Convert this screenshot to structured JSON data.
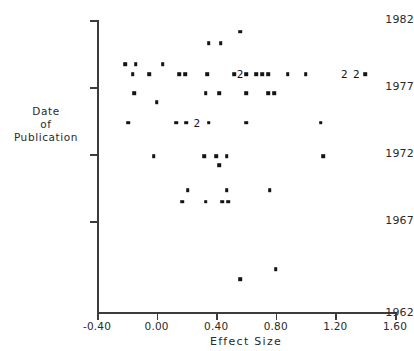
{
  "chart_data": {
    "type": "scatter",
    "title": "",
    "xlabel": "Effect  Size",
    "ylabel": "Date of Publication",
    "ylabel_lines": [
      "Date",
      "of",
      "Publication"
    ],
    "xlim": [
      -0.4,
      1.6
    ],
    "ylim": [
      1962,
      1982
    ],
    "xticks": [
      -0.4,
      0.0,
      0.4,
      0.8,
      1.2,
      1.6
    ],
    "xtick_labels": [
      "-0.40",
      "0.00",
      "0.40",
      "0.80",
      "1.20",
      "1.60"
    ],
    "yticks": [
      1962,
      1967,
      1972,
      1977,
      1982
    ],
    "ytick_labels": [
      "1962",
      "1967",
      "1972",
      "1977",
      "1982"
    ],
    "grid": false,
    "legend": null,
    "marker": "filled-square",
    "marker_color": "#141414",
    "axis_color": "#3c3c3c",
    "background_color": "#ffffff",
    "points": [
      {
        "x": 0.56,
        "y": 1981.2
      },
      {
        "x": 0.35,
        "y": 1980.4
      },
      {
        "x": 0.43,
        "y": 1980.4
      },
      {
        "x": -0.21,
        "y": 1979.0
      },
      {
        "x": -0.14,
        "y": 1979.0
      },
      {
        "x": 0.04,
        "y": 1979.0
      },
      {
        "x": -0.16,
        "y": 1978.3
      },
      {
        "x": -0.05,
        "y": 1978.3
      },
      {
        "x": 0.15,
        "y": 1978.3
      },
      {
        "x": 0.19,
        "y": 1978.3
      },
      {
        "x": 0.34,
        "y": 1978.3
      },
      {
        "x": 0.52,
        "y": 1978.3
      },
      {
        "x": 0.6,
        "y": 1978.3
      },
      {
        "x": 0.67,
        "y": 1978.3
      },
      {
        "x": 0.71,
        "y": 1978.3
      },
      {
        "x": 0.75,
        "y": 1978.3
      },
      {
        "x": 0.88,
        "y": 1978.3
      },
      {
        "x": 1.0,
        "y": 1978.3
      },
      {
        "x": 1.4,
        "y": 1978.3
      },
      {
        "x": -0.15,
        "y": 1977.0
      },
      {
        "x": 0.33,
        "y": 1977.0
      },
      {
        "x": 0.42,
        "y": 1977.0
      },
      {
        "x": 0.6,
        "y": 1977.0
      },
      {
        "x": 0.75,
        "y": 1977.0
      },
      {
        "x": 0.79,
        "y": 1977.0
      },
      {
        "x": 0.0,
        "y": 1976.4
      },
      {
        "x": -0.19,
        "y": 1975.0
      },
      {
        "x": 0.13,
        "y": 1975.0
      },
      {
        "x": 0.2,
        "y": 1975.0
      },
      {
        "x": 0.35,
        "y": 1975.0
      },
      {
        "x": 0.6,
        "y": 1975.0
      },
      {
        "x": 1.1,
        "y": 1975.0
      },
      {
        "x": -0.02,
        "y": 1972.7
      },
      {
        "x": 0.32,
        "y": 1972.7
      },
      {
        "x": 0.4,
        "y": 1972.7
      },
      {
        "x": 0.47,
        "y": 1972.7
      },
      {
        "x": 1.12,
        "y": 1972.7
      },
      {
        "x": 0.42,
        "y": 1972.1
      },
      {
        "x": 0.21,
        "y": 1970.4
      },
      {
        "x": 0.47,
        "y": 1970.4
      },
      {
        "x": 0.76,
        "y": 1970.4
      },
      {
        "x": 0.17,
        "y": 1969.6
      },
      {
        "x": 0.33,
        "y": 1969.6
      },
      {
        "x": 0.44,
        "y": 1969.6
      },
      {
        "x": 0.48,
        "y": 1969.6
      },
      {
        "x": 0.56,
        "y": 1964.3
      },
      {
        "x": 0.8,
        "y": 1965.0
      }
    ],
    "overplot_labels": [
      {
        "x": 0.56,
        "y": 1978.3,
        "text": "2",
        "note": "two overlapping observations"
      },
      {
        "x": 1.26,
        "y": 1978.3,
        "text": "2",
        "note": "two overlapping observations"
      },
      {
        "x": 1.34,
        "y": 1978.3,
        "text": "2",
        "note": "two overlapping observations"
      },
      {
        "x": 0.27,
        "y": 1975.0,
        "text": "2",
        "note": "two overlapping observations"
      }
    ]
  }
}
